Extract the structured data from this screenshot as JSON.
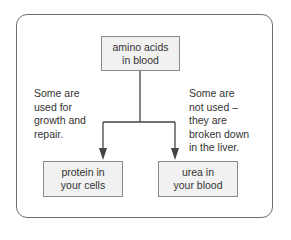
{
  "diagram": {
    "type": "flowchart",
    "source_node": {
      "id": "amino-acids",
      "lines": [
        "amino acids",
        "in blood"
      ]
    },
    "target_nodes": [
      {
        "id": "protein",
        "lines": [
          "protein in",
          "your cells"
        ]
      },
      {
        "id": "urea",
        "lines": [
          "urea in",
          "your blood"
        ]
      }
    ],
    "annotations": [
      {
        "id": "used-note",
        "attached_to": "protein",
        "lines": [
          "Some are",
          "used for",
          "growth and",
          "repair."
        ]
      },
      {
        "id": "not-used-note",
        "attached_to": "urea",
        "lines": [
          "Some are",
          "not used –",
          "they are",
          "broken down",
          "in the liver."
        ]
      }
    ],
    "edges": [
      {
        "from": "amino-acids",
        "to": "protein"
      },
      {
        "from": "amino-acids",
        "to": "urea"
      }
    ],
    "colors": {
      "frame": "#707070",
      "box_fill": "#f1f1f1",
      "box_border": "#8a8a8a",
      "line": "#444444",
      "text": "#333333"
    }
  }
}
